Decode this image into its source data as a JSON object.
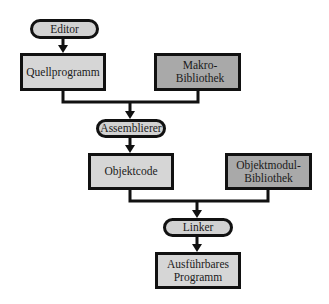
{
  "diagram": {
    "type": "flowchart",
    "colors": {
      "stroke": "#111111",
      "pill_fill": "#d2d2d2",
      "data_fill": "#d6d6d6",
      "library_fill": "#a9a9a9",
      "background": "#ffffff"
    },
    "nodes": {
      "editor": {
        "label": "Editor",
        "kind": "process"
      },
      "quellprogramm": {
        "label": "Quellprogramm",
        "kind": "data"
      },
      "makro_bibliothek": {
        "label": "Makro-Bibliothek",
        "kind": "library"
      },
      "assemblierer": {
        "label": "Assemblierer",
        "kind": "process"
      },
      "objektcode": {
        "label": "Objektcode",
        "kind": "data"
      },
      "objektmodul_bibliothek": {
        "label": "Objektmodul-\nBibliothek",
        "kind": "library"
      },
      "linker": {
        "label": "Linker",
        "kind": "process"
      },
      "ausfuehrbares_programm": {
        "label": "Ausführbares\nProgramm",
        "kind": "data"
      }
    },
    "edges": [
      {
        "from": "Editor",
        "to": "Quellprogramm"
      },
      {
        "from": "Quellprogramm",
        "to": "Assemblierer"
      },
      {
        "from": "Makro-Bibliothek",
        "to": "Assemblierer"
      },
      {
        "from": "Assemblierer",
        "to": "Objektcode"
      },
      {
        "from": "Objektcode",
        "to": "Linker"
      },
      {
        "from": "Objektmodul-Bibliothek",
        "to": "Linker"
      },
      {
        "from": "Linker",
        "to": "Ausführbares Programm"
      }
    ]
  }
}
